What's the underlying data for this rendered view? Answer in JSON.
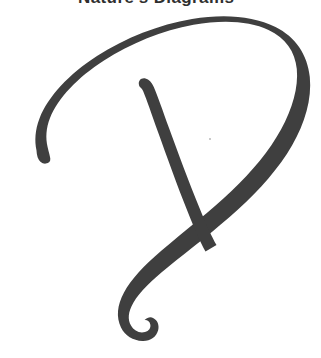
{
  "page": {
    "width": 321,
    "height": 358,
    "background_color": "#ffffff",
    "kind": "scanned-book-page-fragment"
  },
  "header": {
    "running_head": "Nature's Diagrams",
    "clipped": true,
    "visible_portion": "bottom-edge-of-glyphs-only",
    "color": "#2f2f2f",
    "weight": "bold"
  },
  "drawing": {
    "caption": "hand-drawn brush stroke glyph",
    "description": "A single large looping marker stroke resembling a letter P or a stylized loop-with-descender: a broad arc rises from the lower left, sweeps across the top, descends down the right side, then cuts back down to the lower left ending in a small hook; a separate shorter diagonal stroke runs from upper middle down to the crossing point.",
    "ink_color": "#3f3f3f",
    "ink_color_light": "#4a4a4a",
    "stroke_count": 2,
    "strokes": [
      {
        "name": "outer-loop",
        "start": [
          38,
          150
        ],
        "end": [
          140,
          340
        ],
        "max_width": 13,
        "min_width": 8
      },
      {
        "name": "inner-diagonal",
        "start": [
          143,
          82
        ],
        "end": [
          216,
          236
        ],
        "max_width": 12,
        "min_width": 8
      }
    ],
    "speck": {
      "x": 209,
      "y": 138,
      "color": "#b9b9b9"
    }
  }
}
